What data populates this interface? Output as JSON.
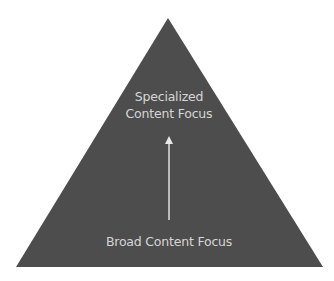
{
  "diagram": {
    "type": "pyramid",
    "fill_color": "#4d4d4d",
    "text_color": "#d6d6d6",
    "arrow_color": "#e0e0e0",
    "background_color": "#ffffff",
    "top_label": {
      "line1": "Specialized",
      "line2": "Content Focus"
    },
    "bottom_label": "Broad Content Focus",
    "arrow": {
      "direction": "up",
      "from": "Broad Content Focus",
      "to": "Specialized Content Focus"
    }
  }
}
